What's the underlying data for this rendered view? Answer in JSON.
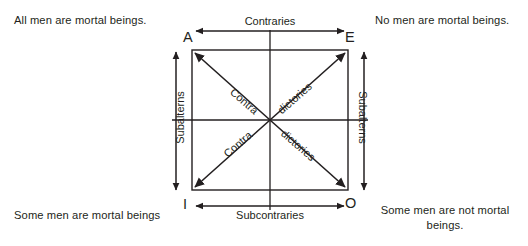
{
  "diagram": {
    "statements": {
      "a": "All men are mortal beings.",
      "e": "No men are mortal beings.",
      "i": "Some men are mortal beings",
      "o": "Some men are not mortal beings."
    },
    "vertices": {
      "a": "A",
      "e": "E",
      "i": "I",
      "o": "O"
    },
    "relations": {
      "contraries": "Contraries",
      "subcontraries": "Subcontraries",
      "subalterns_left": "Subalterns",
      "subalterns_right": "Subalterns",
      "contradictories_upper_left": "Contra",
      "contradictories_upper_right": "dictories",
      "contradictories_lower_left": "Contra",
      "contradictories_lower_right": "dictories"
    },
    "colors": {
      "ink": "#231f20",
      "background": "#ffffff"
    }
  }
}
